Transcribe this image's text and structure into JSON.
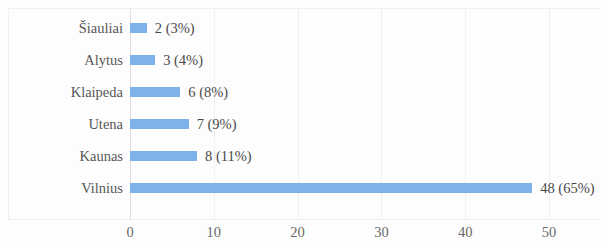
{
  "chart_data": {
    "type": "bar",
    "orientation": "horizontal",
    "title": "",
    "subtitle": "",
    "xlabel": "",
    "ylabel": "",
    "categories": [
      "Šiauliai",
      "Alytus",
      "Klaipeda",
      "Utena",
      "Kaunas",
      "Vilnius"
    ],
    "values": [
      2,
      3,
      6,
      7,
      8,
      48
    ],
    "percent_labels": [
      "3%",
      "4%",
      "8%",
      "9%",
      "11%",
      "65%"
    ],
    "data_labels": [
      "2 (3%)",
      "3 (4%)",
      "6 (8%)",
      "7 (9%)",
      "8 (11%)",
      "48 (65%)"
    ],
    "xlim": [
      0,
      50
    ],
    "xticks": [
      0,
      10,
      20,
      30,
      40,
      50
    ],
    "xtick_labels": [
      "0",
      "10",
      "20",
      "30",
      "40",
      "50"
    ],
    "grid": true,
    "grid_axis": "x",
    "legend": false,
    "legend_position": "none",
    "bar_color": "#7FB2EA",
    "gridline_color": "#e3e3e6",
    "text_color": "#575757",
    "background_color": "#fdfdfd"
  }
}
